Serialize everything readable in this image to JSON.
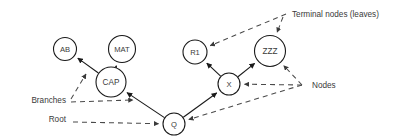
{
  "figure": {
    "background_color": "#ffffff",
    "line_color": "#1a1a1a",
    "dashed_line_color": "#4a4a4a",
    "text_color": "#3a3a3a"
  },
  "nodes": [
    {
      "id": "AB",
      "label": "AB",
      "cx": 65,
      "cy": 49,
      "r": 11.5,
      "font_size": 7.6,
      "kind": "terminal"
    },
    {
      "id": "MAT",
      "label": "MAT",
      "cx": 122,
      "cy": 49,
      "r": 13.5,
      "font_size": 7.6,
      "kind": "terminal"
    },
    {
      "id": "CAP",
      "label": "CAP",
      "cx": 111,
      "cy": 82,
      "r": 15.0,
      "font_size": 8.2,
      "kind": "internal"
    },
    {
      "id": "R1",
      "label": "R1",
      "cx": 195,
      "cy": 52,
      "r": 12.0,
      "font_size": 7.6,
      "kind": "terminal"
    },
    {
      "id": "ZZZ",
      "label": "ZZZ",
      "cx": 270,
      "cy": 51,
      "r": 15.5,
      "font_size": 8.2,
      "kind": "terminal"
    },
    {
      "id": "X",
      "label": "X",
      "cx": 229,
      "cy": 84,
      "r": 11.0,
      "font_size": 7.6,
      "kind": "internal"
    },
    {
      "id": "Q",
      "label": "Q",
      "cx": 174,
      "cy": 124,
      "r": 11.0,
      "font_size": 7.6,
      "kind": "root"
    }
  ],
  "edges": [
    {
      "id": "cap-ab",
      "from": "CAP",
      "to": "AB",
      "style": "solid",
      "arrow": "to"
    },
    {
      "id": "cap-mat",
      "from": "CAP",
      "to": "MAT",
      "style": "solid",
      "arrow": "to"
    },
    {
      "id": "q-cap",
      "from": "Q",
      "to": "CAP",
      "style": "solid",
      "arrow": "to"
    },
    {
      "id": "q-x",
      "from": "Q",
      "to": "X",
      "style": "solid",
      "arrow": "to"
    },
    {
      "id": "x-r1",
      "from": "X",
      "to": "R1",
      "style": "solid",
      "arrow": "to"
    },
    {
      "id": "x-zzz",
      "from": "X",
      "to": "ZZZ",
      "style": "solid",
      "arrow": "to"
    }
  ],
  "annotations": [
    {
      "id": "terminal-nodes",
      "label": "Terminal nodes (leaves)",
      "text_x": 292,
      "text_y": 17,
      "anchor": "start",
      "pointers": [
        {
          "id": "pointer-terminal-r1",
          "target": "R1",
          "from_x": 286,
          "from_y": 14,
          "to_x": 207,
          "to_y": 44
        },
        {
          "id": "pointer-terminal-zzz",
          "target": "ZZZ",
          "from_x": 283,
          "from_y": 17,
          "to_x": 273,
          "to_y": 34
        }
      ]
    },
    {
      "id": "nodes",
      "label": "Nodes",
      "text_x": 312,
      "text_y": 88,
      "anchor": "start",
      "hub_x": 302,
      "hub_y": 85,
      "pointers": [
        {
          "id": "pointer-nodes-zzz",
          "target": "ZZZ",
          "from_x": 302,
          "from_y": 85,
          "to_x": 281,
          "to_y": 63
        },
        {
          "id": "pointer-nodes-x",
          "target": "X",
          "from_x": 302,
          "from_y": 85,
          "to_x": 243,
          "to_y": 83
        },
        {
          "id": "pointer-nodes-q",
          "target": "Q",
          "from_x": 302,
          "from_y": 85,
          "to_x": 188,
          "to_y": 123
        }
      ]
    },
    {
      "id": "branches",
      "label": "Branches",
      "text_x": 66,
      "text_y": 103,
      "anchor": "end",
      "pointers": [
        {
          "id": "pointer-branches-upper",
          "target": "cap-ab",
          "from_x": 71,
          "from_y": 99,
          "to_x": 86,
          "to_y": 74
        },
        {
          "id": "pointer-branches-lower",
          "target": "q-cap",
          "from_x": 71,
          "from_y": 102,
          "to_x": 133,
          "to_y": 100
        }
      ]
    },
    {
      "id": "root",
      "label": "Root",
      "text_x": 66,
      "text_y": 122,
      "anchor": "end",
      "pointers": [
        {
          "id": "pointer-root-q",
          "target": "Q",
          "from_x": 73,
          "from_y": 122,
          "to_x": 160,
          "to_y": 124
        }
      ]
    }
  ]
}
